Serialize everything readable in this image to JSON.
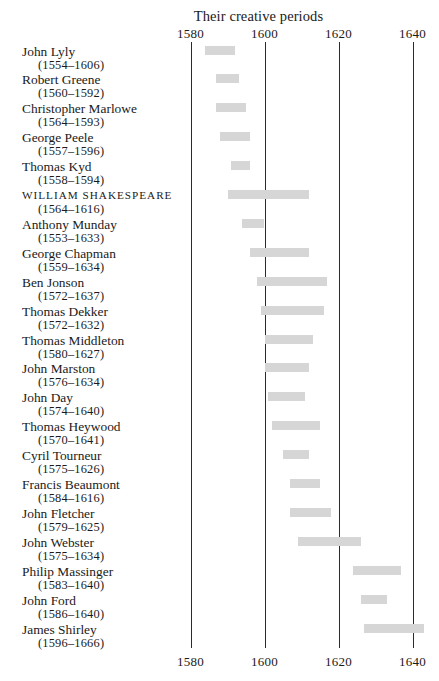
{
  "chart_data": {
    "type": "bar",
    "orientation": "horizontal-timeline",
    "title": "Their creative periods",
    "xlabel": "",
    "ylabel": "",
    "xlim": [
      1575,
      1645
    ],
    "axis_ticks": [
      1580,
      1600,
      1620,
      1640
    ],
    "axis_tick_labels": [
      "1580",
      "1600",
      "1620",
      "1640"
    ],
    "axis_position": "top-and-bottom",
    "grid": true,
    "legend": null,
    "bar_color": "#d6d6d6",
    "axis_color": "#2b2b2b",
    "categories": [
      "John Lyly",
      "Robert Greene",
      "Christopher Marlowe",
      "George Peele",
      "Thomas Kyd",
      "William Shakespeare",
      "Anthony Munday",
      "George Chapman",
      "Ben Jonson",
      "Thomas Dekker",
      "Thomas Middleton",
      "John Marston",
      "John Day",
      "Thomas Heywood",
      "Cyril Tourneur",
      "Francis Beaumont",
      "John Fletcher",
      "John Webster",
      "Philip Massinger",
      "John Ford",
      "James Shirley"
    ],
    "rows": [
      {
        "name": "John Lyly",
        "dates": "(1554–1606)",
        "lifespan": [
          1554,
          1606
        ],
        "period_start": 1584,
        "period_end": 1592,
        "emphasis": false
      },
      {
        "name": "Robert Greene",
        "dates": "(1560–1592)",
        "lifespan": [
          1560,
          1592
        ],
        "period_start": 1587,
        "period_end": 1593,
        "emphasis": false
      },
      {
        "name": "Christopher Marlowe",
        "dates": "(1564–1593)",
        "lifespan": [
          1564,
          1593
        ],
        "period_start": 1587,
        "period_end": 1595,
        "emphasis": false
      },
      {
        "name": "George Peele",
        "dates": "(1557–1596)",
        "lifespan": [
          1557,
          1596
        ],
        "period_start": 1588,
        "period_end": 1596,
        "emphasis": false
      },
      {
        "name": "Thomas Kyd",
        "dates": "(1558–1594)",
        "lifespan": [
          1558,
          1594
        ],
        "period_start": 1591,
        "period_end": 1596,
        "emphasis": false
      },
      {
        "name": "WILLIAM SHAKESPEARE",
        "dates": "(1564–1616)",
        "lifespan": [
          1564,
          1616
        ],
        "period_start": 1590,
        "period_end": 1612,
        "emphasis": true
      },
      {
        "name": "Anthony Munday",
        "dates": "(1553–1633)",
        "lifespan": [
          1553,
          1633
        ],
        "period_start": 1594,
        "period_end": 1600,
        "emphasis": false
      },
      {
        "name": "George Chapman",
        "dates": "(1559–1634)",
        "lifespan": [
          1559,
          1634
        ],
        "period_start": 1596,
        "period_end": 1612,
        "emphasis": false
      },
      {
        "name": "Ben Jonson",
        "dates": "(1572–1637)",
        "lifespan": [
          1572,
          1637
        ],
        "period_start": 1598,
        "period_end": 1617,
        "emphasis": false
      },
      {
        "name": "Thomas Dekker",
        "dates": "(1572–1632)",
        "lifespan": [
          1572,
          1632
        ],
        "period_start": 1599,
        "period_end": 1616,
        "emphasis": false
      },
      {
        "name": "Thomas Middleton",
        "dates": "(1580–1627)",
        "lifespan": [
          1580,
          1627
        ],
        "period_start": 1600,
        "period_end": 1613,
        "emphasis": false
      },
      {
        "name": "John Marston",
        "dates": "(1576–1634)",
        "lifespan": [
          1576,
          1634
        ],
        "period_start": 1600,
        "period_end": 1612,
        "emphasis": false
      },
      {
        "name": "John Day",
        "dates": "(1574–1640)",
        "lifespan": [
          1574,
          1640
        ],
        "period_start": 1601,
        "period_end": 1611,
        "emphasis": false
      },
      {
        "name": "Thomas Heywood",
        "dates": "(1570–1641)",
        "lifespan": [
          1570,
          1641
        ],
        "period_start": 1602,
        "period_end": 1615,
        "emphasis": false
      },
      {
        "name": "Cyril Tourneur",
        "dates": "(1575–1626)",
        "lifespan": [
          1575,
          1626
        ],
        "period_start": 1605,
        "period_end": 1612,
        "emphasis": false
      },
      {
        "name": "Francis Beaumont",
        "dates": "(1584–1616)",
        "lifespan": [
          1584,
          1616
        ],
        "period_start": 1607,
        "period_end": 1615,
        "emphasis": false
      },
      {
        "name": "John Fletcher",
        "dates": "(1579–1625)",
        "lifespan": [
          1579,
          1625
        ],
        "period_start": 1607,
        "period_end": 1618,
        "emphasis": false
      },
      {
        "name": "John Webster",
        "dates": "(1575–1634)",
        "lifespan": [
          1575,
          1634
        ],
        "period_start": 1609,
        "period_end": 1626,
        "emphasis": false
      },
      {
        "name": "Philip Massinger",
        "dates": "(1583–1640)",
        "lifespan": [
          1583,
          1640
        ],
        "period_start": 1624,
        "period_end": 1637,
        "emphasis": false
      },
      {
        "name": "John Ford",
        "dates": "(1586–1640)",
        "lifespan": [
          1586,
          1640
        ],
        "period_start": 1626,
        "period_end": 1633,
        "emphasis": false
      },
      {
        "name": "James Shirley",
        "dates": "(1596–1666)",
        "lifespan": [
          1596,
          1666
        ],
        "period_start": 1627,
        "period_end": 1643,
        "emphasis": false
      }
    ]
  }
}
